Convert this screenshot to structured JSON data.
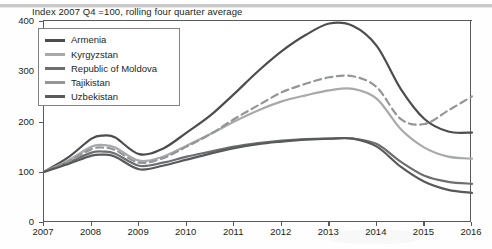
{
  "chart_data": {
    "type": "line",
    "title": "Index 2007 Q4 =100, rolling four quarter average",
    "xlabel": "",
    "ylabel": "",
    "xlim": [
      2007,
      2016
    ],
    "ylim": [
      0,
      400
    ],
    "yticks": [
      "0",
      "100",
      "200",
      "300",
      "400"
    ],
    "xticks": [
      "2007",
      "2008",
      "2009",
      "2010",
      "2011",
      "2012",
      "2013",
      "2014",
      "2015",
      "2016"
    ],
    "grid": false,
    "legend_position": "top-left",
    "x": [
      2007,
      2007.5,
      2008,
      2008.25,
      2008.5,
      2009,
      2009.5,
      2010,
      2010.5,
      2011,
      2011.5,
      2012,
      2012.5,
      2013,
      2013.5,
      2014,
      2014.5,
      2015,
      2015.5,
      2016
    ],
    "series": [
      {
        "name": "Armenia",
        "color": "#4d4d4f",
        "style": "solid",
        "values": [
          100,
          128,
          166,
          172,
          168,
          135,
          146,
          178,
          212,
          255,
          300,
          340,
          372,
          395,
          390,
          350,
          265,
          205,
          180,
          178
        ]
      },
      {
        "name": "Kyrgyzstan",
        "color": "#a7a9ac",
        "style": "solid",
        "values": [
          100,
          122,
          150,
          153,
          148,
          122,
          130,
          152,
          175,
          200,
          222,
          240,
          252,
          262,
          265,
          245,
          185,
          148,
          130,
          126
        ]
      },
      {
        "name": "Republic of Moldova",
        "color": "#6d6e71",
        "style": "solid",
        "values": [
          100,
          118,
          138,
          140,
          136,
          112,
          118,
          130,
          140,
          150,
          157,
          162,
          165,
          166,
          166,
          155,
          120,
          92,
          80,
          76
        ]
      },
      {
        "name": "Tajikistan",
        "color": "#939598",
        "style": "dashed",
        "values": [
          100,
          120,
          145,
          148,
          143,
          118,
          127,
          150,
          175,
          205,
          232,
          258,
          275,
          288,
          290,
          268,
          205,
          195,
          222,
          250
        ]
      },
      {
        "name": "Uzbekistan",
        "color": "#58595b",
        "style": "solid",
        "values": [
          100,
          115,
          132,
          134,
          130,
          105,
          112,
          124,
          136,
          147,
          155,
          160,
          164,
          166,
          166,
          150,
          110,
          80,
          64,
          58
        ]
      }
    ]
  }
}
